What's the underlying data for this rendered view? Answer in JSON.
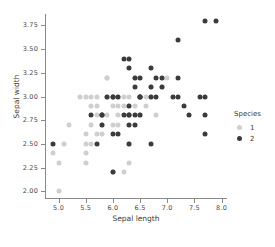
{
  "chart_data": {
    "type": "scatter",
    "title": "",
    "xlabel": "Sepal length",
    "ylabel": "Sepal width",
    "xlim": [
      4.75,
      8.1
    ],
    "ylim": [
      1.93,
      3.87
    ],
    "xticks": [
      "5.0",
      "5.5",
      "6.0",
      "6.5",
      "7.0",
      "7.5",
      "8.0"
    ],
    "xtick_values": [
      5.0,
      5.5,
      6.0,
      6.5,
      7.0,
      7.5,
      8.0
    ],
    "yticks": [
      "2.00",
      "2.25",
      "2.50",
      "2.75",
      "3.00",
      "3.25",
      "3.50",
      "3.75"
    ],
    "ytick_values": [
      2.0,
      2.25,
      2.5,
      2.75,
      3.0,
      3.25,
      3.5,
      3.75
    ],
    "grid": false,
    "legend": {
      "title": "Species",
      "position": "right",
      "entries": [
        {
          "label": "1",
          "color": "#cfcfcf"
        },
        {
          "label": "2",
          "color": "#3b3b3b"
        }
      ]
    },
    "series": [
      {
        "name": "1",
        "color": "#cfcfcf",
        "points": [
          [
            4.9,
            2.4
          ],
          [
            5.0,
            2.3
          ],
          [
            5.0,
            2.0
          ],
          [
            5.1,
            2.5
          ],
          [
            5.2,
            2.7
          ],
          [
            5.4,
            3.0
          ],
          [
            5.5,
            2.6
          ],
          [
            5.5,
            2.4
          ],
          [
            5.5,
            2.5
          ],
          [
            5.5,
            2.3
          ],
          [
            5.6,
            3.0
          ],
          [
            5.6,
            2.9
          ],
          [
            5.6,
            2.5
          ],
          [
            5.6,
            2.7
          ],
          [
            5.7,
            3.0
          ],
          [
            5.7,
            2.9
          ],
          [
            5.7,
            2.8
          ],
          [
            5.7,
            2.6
          ],
          [
            5.8,
            2.7
          ],
          [
            5.8,
            2.6
          ],
          [
            5.9,
            3.2
          ],
          [
            5.9,
            3.0
          ],
          [
            5.9,
            3.2
          ],
          [
            6.0,
            2.9
          ],
          [
            6.0,
            2.7
          ],
          [
            6.0,
            2.2
          ],
          [
            6.1,
            2.9
          ],
          [
            6.1,
            2.8
          ],
          [
            6.1,
            3.0
          ],
          [
            6.2,
            2.9
          ],
          [
            6.2,
            2.2
          ],
          [
            6.3,
            2.5
          ],
          [
            6.3,
            2.3
          ],
          [
            6.4,
            2.9
          ],
          [
            6.5,
            2.8
          ],
          [
            6.6,
            2.9
          ],
          [
            6.6,
            3.0
          ],
          [
            6.7,
            3.1
          ],
          [
            6.7,
            3.0
          ],
          [
            6.8,
            2.8
          ],
          [
            6.9,
            3.1
          ],
          [
            7.0,
            3.2
          ],
          [
            5.5,
            3.0
          ],
          [
            5.8,
            2.8
          ],
          [
            6.3,
            3.0
          ],
          [
            6.4,
            3.2
          ],
          [
            6.2,
            3.0
          ],
          [
            6.1,
            2.7
          ],
          [
            5.9,
            2.8
          ]
        ]
      },
      {
        "name": "2",
        "color": "#3b3b3b",
        "points": [
          [
            4.9,
            2.5
          ],
          [
            5.6,
            2.8
          ],
          [
            5.7,
            2.5
          ],
          [
            5.8,
            2.8
          ],
          [
            5.8,
            2.7
          ],
          [
            5.8,
            2.8
          ],
          [
            5.9,
            3.0
          ],
          [
            6.0,
            3.0
          ],
          [
            6.0,
            2.6
          ],
          [
            6.0,
            2.2
          ],
          [
            6.1,
            3.0
          ],
          [
            6.1,
            2.6
          ],
          [
            6.2,
            3.4
          ],
          [
            6.2,
            2.8
          ],
          [
            6.3,
            3.4
          ],
          [
            6.3,
            3.3
          ],
          [
            6.3,
            2.9
          ],
          [
            6.3,
            2.8
          ],
          [
            6.3,
            2.7
          ],
          [
            6.3,
            2.5
          ],
          [
            6.4,
            3.2
          ],
          [
            6.4,
            2.8
          ],
          [
            6.4,
            2.7
          ],
          [
            6.4,
            3.1
          ],
          [
            6.5,
            3.2
          ],
          [
            6.5,
            3.0
          ],
          [
            6.5,
            3.0
          ],
          [
            6.5,
            2.8
          ],
          [
            6.7,
            3.3
          ],
          [
            6.7,
            3.1
          ],
          [
            6.7,
            3.0
          ],
          [
            6.7,
            2.5
          ],
          [
            6.8,
            3.2
          ],
          [
            6.8,
            3.0
          ],
          [
            6.9,
            3.2
          ],
          [
            6.9,
            3.1
          ],
          [
            7.1,
            3.0
          ],
          [
            7.2,
            3.6
          ],
          [
            7.2,
            3.2
          ],
          [
            7.2,
            3.0
          ],
          [
            7.3,
            2.9
          ],
          [
            7.4,
            2.8
          ],
          [
            7.6,
            3.0
          ],
          [
            7.7,
            3.8
          ],
          [
            7.7,
            3.0
          ],
          [
            7.7,
            2.8
          ],
          [
            7.7,
            2.6
          ],
          [
            7.9,
            3.8
          ],
          [
            6.0,
            3.0
          ],
          [
            6.3,
            2.8
          ],
          [
            6.5,
            3.0
          ]
        ]
      }
    ]
  }
}
